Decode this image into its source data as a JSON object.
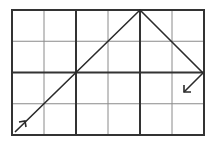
{
  "diagram": {
    "title": "",
    "grid": {
      "columns": 6,
      "rows": 4,
      "origin": [
        12,
        10
      ],
      "cell_width": 32,
      "cell_height": 31.25,
      "thin_color": "#8a8a8a",
      "thick_color": "#333333",
      "thick_columns": [
        0,
        2,
        4,
        6
      ],
      "thick_rows": [
        0,
        2,
        4
      ],
      "thin_columns": [
        1,
        3,
        5
      ],
      "thin_rows": [
        1,
        3
      ]
    },
    "path": {
      "color": "#2a2a2a",
      "points": [
        [
          15,
          132
        ],
        [
          140,
          10
        ],
        [
          203,
          73
        ]
      ],
      "description": "Ray enters lower-left, rises to top edge, reflects down to right edge, then reflects down-left"
    },
    "exit_arrow": {
      "from": [
        203,
        73
      ],
      "to": [
        184,
        92
      ]
    },
    "entry_arrow_at": [
      25,
      122
    ]
  }
}
